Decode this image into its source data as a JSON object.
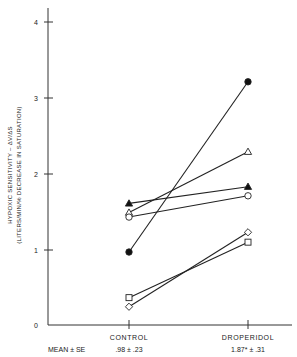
{
  "chart_data": {
    "type": "line",
    "title": "",
    "xlabel": "",
    "ylabel": "HYPOXIC SENSITIVITY – ΔV/ΔS",
    "ylabel_sub": "(LITERS/MIN/% DECREASE IN SATURATION)",
    "categories": [
      "CONTROL",
      "DROPERIDOL"
    ],
    "ylim": [
      0,
      4
    ],
    "yticks": [
      0,
      1,
      2,
      3,
      4
    ],
    "grid": false,
    "legend": "none",
    "series": [
      {
        "name": "Subject 1",
        "marker": "filled-circle",
        "values": [
          0.96,
          3.2
        ]
      },
      {
        "name": "Subject 2",
        "marker": "open-triangle",
        "values": [
          1.48,
          2.28
        ]
      },
      {
        "name": "Subject 3",
        "marker": "filled-triangle",
        "values": [
          1.6,
          1.82
        ]
      },
      {
        "name": "Subject 4",
        "marker": "open-circle",
        "values": [
          1.42,
          1.7
        ]
      },
      {
        "name": "Subject 5",
        "marker": "open-diamond",
        "values": [
          0.24,
          1.22
        ]
      },
      {
        "name": "Subject 6",
        "marker": "open-square",
        "values": [
          0.36,
          1.09
        ]
      }
    ],
    "summary": {
      "label": "MEAN ± SE",
      "values": [
        ".98 ± .23",
        "1.87* ± .31"
      ]
    }
  },
  "axis": {
    "ylabel_line1": "HYPOXIC SENSITIVITY  –  ΔV/ΔS",
    "ylabel_line2": "(LITERS/MIN/% DECREASE IN SATURATION)",
    "ytick_labels": [
      "0",
      "1",
      "2",
      "3",
      "4"
    ],
    "xcat_labels": [
      "CONTROL",
      "DROPERIDOL"
    ]
  },
  "summary_row": {
    "label": "MEAN ± SE",
    "control": ".98 ± .23",
    "droperidol": "1.87* ± .31"
  }
}
